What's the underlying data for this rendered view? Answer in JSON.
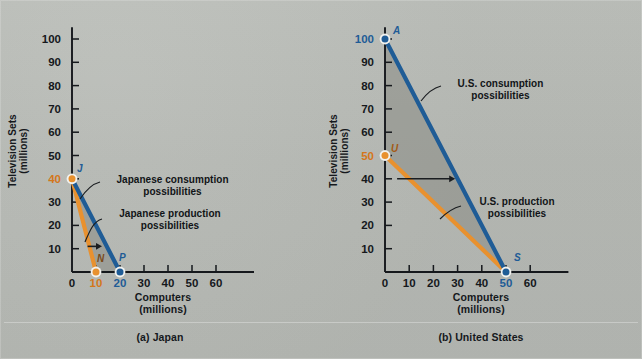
{
  "figure": {
    "background_color": "#b7bab5",
    "panels": [
      {
        "id": "japan",
        "caption": "(a) Japan",
        "xlabel_line1": "Computers",
        "xlabel_line2": "(millions)",
        "ylabel_line1": "Television Sets",
        "ylabel_line2": "(millions)"
      },
      {
        "id": "united-states",
        "caption": "(b) United States",
        "xlabel_line1": "Computers",
        "xlabel_line2": "(millions)",
        "ylabel_line1": "Television Sets",
        "ylabel_line2": "(millions)"
      }
    ]
  },
  "colors": {
    "production_orange": "#e8912f",
    "consumption_blue": "#1f5c96",
    "axis_black": "#15181c",
    "shade_gray": "#8e9089",
    "orange_text": "#d4761b",
    "blue_text": "#1f5c96"
  },
  "chart_data": [
    {
      "type": "line",
      "title": "(a) Japan",
      "xlabel": "Computers (millions)",
      "ylabel": "Television Sets (millions)",
      "xlim": [
        0,
        70
      ],
      "ylim": [
        0,
        105
      ],
      "xticks": [
        0,
        10,
        20,
        30,
        40,
        50,
        60
      ],
      "yticks": [
        10,
        20,
        30,
        40,
        50,
        60,
        70,
        80,
        90,
        100
      ],
      "xtick_labels": [
        "0",
        "10",
        "20",
        "30",
        "40",
        "50",
        "60"
      ],
      "ytick_labels": [
        "10",
        "20",
        "30",
        "40",
        "50",
        "60",
        "70",
        "80",
        "90",
        "100"
      ],
      "grid": false,
      "legend": "annotations",
      "series": [
        {
          "name": "Japanese production possibilities",
          "color": "#e8912f",
          "x": [
            0,
            10
          ],
          "y": [
            40,
            0
          ]
        },
        {
          "name": "Japanese consumption possibilities",
          "color": "#1f5c96",
          "x": [
            0,
            20
          ],
          "y": [
            40,
            0
          ]
        }
      ],
      "points": [
        {
          "label": "J",
          "x": 0,
          "y": 40,
          "color": "#e8912f"
        },
        {
          "label": "N",
          "x": 10,
          "y": 0,
          "color": "#e8912f"
        },
        {
          "label": "P",
          "x": 20,
          "y": 0,
          "color": "#1f5c96"
        }
      ],
      "highlighted_ticks": [
        {
          "axis": "y",
          "value": 40,
          "color": "#d4761b"
        },
        {
          "axis": "x",
          "value": 10,
          "color": "#d4761b"
        },
        {
          "axis": "x",
          "value": 20,
          "color": "#1f5c96"
        }
      ],
      "annotations": [
        {
          "text": "Japanese consumption\npossibilities",
          "x_px": 172,
          "y_px": 181
        },
        {
          "text": "Japanese production\npossibilities",
          "x_px": 169,
          "y_px": 215
        }
      ],
      "gain_arrow": {
        "from_x": 6.5,
        "from_y": 11,
        "to_x": 12.5,
        "to_y": 11
      }
    },
    {
      "type": "line",
      "title": "(b) United States",
      "xlabel": "Computers (millions)",
      "ylabel": "Television Sets (millions)",
      "xlim": [
        0,
        70
      ],
      "ylim": [
        0,
        105
      ],
      "xticks": [
        0,
        10,
        20,
        30,
        40,
        50,
        60
      ],
      "yticks": [
        10,
        20,
        30,
        40,
        50,
        60,
        70,
        80,
        90,
        100
      ],
      "xtick_labels": [
        "0",
        "10",
        "20",
        "30",
        "40",
        "50",
        "60"
      ],
      "ytick_labels": [
        "10",
        "20",
        "30",
        "40",
        "50",
        "60",
        "70",
        "80",
        "90",
        "100"
      ],
      "grid": false,
      "legend": "annotations",
      "series": [
        {
          "name": "U.S. production possibilities",
          "color": "#e8912f",
          "x": [
            0,
            50
          ],
          "y": [
            50,
            0
          ]
        },
        {
          "name": "U.S. consumption possibilities",
          "color": "#1f5c96",
          "x": [
            0,
            50
          ],
          "y": [
            100,
            0
          ]
        }
      ],
      "points": [
        {
          "label": "A",
          "x": 0,
          "y": 100,
          "color": "#1f5c96"
        },
        {
          "label": "U",
          "x": 0,
          "y": 50,
          "color": "#e8912f"
        },
        {
          "label": "S",
          "x": 50,
          "y": 0,
          "color": "#1f5c96"
        }
      ],
      "highlighted_ticks": [
        {
          "axis": "y",
          "value": 100,
          "color": "#1f5c96"
        },
        {
          "axis": "y",
          "value": 50,
          "color": "#d4761b"
        },
        {
          "axis": "x",
          "value": 50,
          "color": "#1f5c96"
        }
      ],
      "annotations": [
        {
          "text": "U.S. consumption\npossibilities",
          "x_px": 170,
          "y_px": 86
        },
        {
          "text": "U.S. production\npossibilities",
          "x_px": 189,
          "y_px": 204
        }
      ],
      "gain_arrow": {
        "from_x": 5,
        "from_y": 40,
        "to_x": 29,
        "to_y": 40
      }
    }
  ]
}
